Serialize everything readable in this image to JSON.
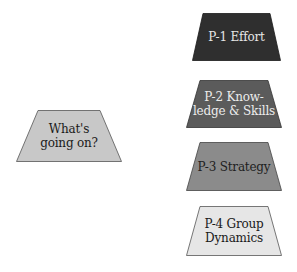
{
  "diagram": {
    "center": {
      "lines": [
        "What's",
        "going on?"
      ],
      "fill": "#c8c8c8",
      "text_color": "#1a1a1a"
    },
    "items": [
      {
        "lines": [
          "P-1 Effort"
        ],
        "fill": "#2f2f2f",
        "text_color": "#e6e6e6"
      },
      {
        "lines": [
          "P-2 Know-",
          "ledge & Skills"
        ],
        "fill": "#5b5b5b",
        "text_color": "#ececec"
      },
      {
        "lines": [
          "P-3 Strategy"
        ],
        "fill": "#8b8b8b",
        "text_color": "#1e1e1e"
      },
      {
        "lines": [
          "P-4 Group",
          "Dynamics"
        ],
        "fill": "#e6e6e6",
        "text_color": "#1a1a1a"
      }
    ]
  }
}
